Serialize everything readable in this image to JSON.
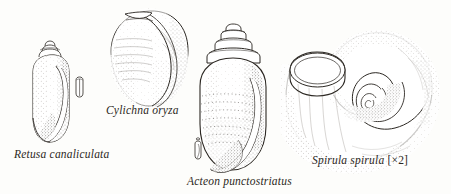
{
  "plate": {
    "title": "Marine gastropod shells illustration plate",
    "background_color": "#fdfdfb",
    "ink_color": "#2b2722",
    "width": 451,
    "height": 194
  },
  "specimens": [
    {
      "id": "retusa",
      "label": "Retusa canaliculata",
      "magnification": "",
      "shape": "elongate-oval shell with small stepped spire and long aperture",
      "has_scale_figure": true,
      "scale_figure_name": "actual-size-silhouette"
    },
    {
      "id": "cylichna",
      "label": "Cylichna oryza",
      "magnification": "",
      "shape": "barrel-shaped cylindrical shell, rounded ends",
      "has_scale_figure": false,
      "scale_figure_name": ""
    },
    {
      "id": "acteon",
      "label": "Acteon punctostriatus",
      "magnification": "",
      "shape": "ovate shell with stepped conical spire and punctate spiral striae",
      "has_scale_figure": true,
      "scale_figure_name": "actual-size-silhouette"
    },
    {
      "id": "spirula",
      "label": "Spirula spirula",
      "magnification": "[×2]",
      "shape": "open planispiral coiled tubular shell",
      "has_scale_figure": false,
      "scale_figure_name": ""
    }
  ]
}
